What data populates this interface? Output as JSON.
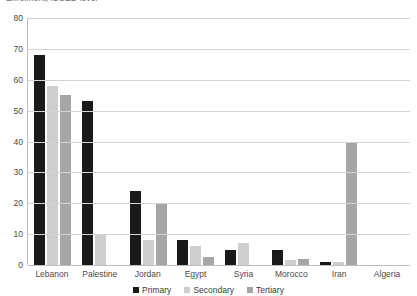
{
  "chart_data": {
    "type": "bar",
    "title": "Enrolment, ISCED level",
    "xlabel": "",
    "ylabel": "",
    "ylim": [
      0,
      80
    ],
    "yticks": [
      0,
      10,
      20,
      30,
      40,
      50,
      60,
      70,
      80
    ],
    "grid": true,
    "legend_position": "bottom",
    "categories": [
      "Lebanon",
      "Palestine",
      "Jordan",
      "Egypt",
      "Syria",
      "Morocco",
      "Iran",
      "Algeria"
    ],
    "series": [
      {
        "name": "Primary",
        "color": "#1a1a1a",
        "values": [
          68,
          53,
          24,
          8,
          5,
          5,
          1,
          0
        ]
      },
      {
        "name": "Secondary",
        "color": "#cfcfcf",
        "values": [
          58,
          10,
          8,
          6,
          7,
          1.5,
          1,
          0
        ]
      },
      {
        "name": "Tertiary",
        "color": "#a6a6a6",
        "values": [
          55,
          0,
          20,
          2.5,
          0,
          2,
          40,
          0
        ]
      }
    ]
  },
  "legend": {
    "items": [
      {
        "label": "Primary"
      },
      {
        "label": "Secondary"
      },
      {
        "label": "Tertiary"
      }
    ]
  }
}
